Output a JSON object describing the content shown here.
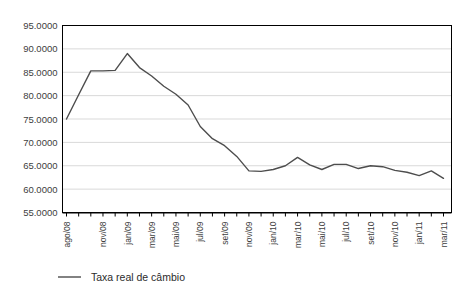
{
  "chart_data": {
    "type": "line",
    "title": "",
    "xlabel": "",
    "ylabel": "",
    "ylim": [
      55.0,
      95.0
    ],
    "ytick_step": 5.0,
    "ytick_labels": [
      "95.0000",
      "90.0000",
      "85.0000",
      "80.0000",
      "75.0000",
      "70.0000",
      "65.0000",
      "60.0000",
      "55.0000"
    ],
    "ytick_values": [
      95.0,
      90.0,
      85.0,
      80.0,
      75.0,
      70.0,
      65.0,
      60.0,
      55.0
    ],
    "grid": true,
    "grid_axis": "y",
    "legend_position": "bottom-left",
    "line_color": "#4d4d4d",
    "axis_color": "#000000",
    "grid_color": "#d9d9d9",
    "plot_background": "#ffffff",
    "x": [
      "ago/08",
      "set/08",
      "out/08",
      "nov/08",
      "dez/08",
      "jan/09",
      "fev/09",
      "mar/09",
      "abr/09",
      "mai/09",
      "jun/09",
      "jul/09",
      "ago/09",
      "set/09",
      "out/09",
      "nov/09",
      "dez/09",
      "jan/10",
      "fev/10",
      "mar/10",
      "abr/10",
      "mai/10",
      "jun/10",
      "jul/10",
      "ago/10",
      "set/10",
      "out/10",
      "nov/10",
      "dez/10",
      "jan/11",
      "fev/11",
      "mar/11"
    ],
    "xtick_labels_shown": [
      "ago/08",
      "nov/08",
      "jan/09",
      "mar/09",
      "mai/09",
      "jul/09",
      "set/09",
      "nov/09",
      "jan/10",
      "mar/10",
      "mai/10",
      "jul/10",
      "set/10",
      "nov/10",
      "jan/11",
      "mar/11"
    ],
    "series": [
      {
        "name": "Taxa real de câmbio",
        "values": [
          75.0,
          80.2,
          85.3,
          85.3,
          85.4,
          89.0,
          86.0,
          84.2,
          82.0,
          80.3,
          78.0,
          73.4,
          70.8,
          69.3,
          67.0,
          63.9,
          63.8,
          64.2,
          65.0,
          66.8,
          65.2,
          64.2,
          65.3,
          65.3,
          64.4,
          65.0,
          64.8,
          64.0,
          63.6,
          62.9,
          63.9,
          62.3
        ]
      }
    ]
  },
  "legend": {
    "items": [
      {
        "label": "Taxa real de câmbio",
        "color": "#4d4d4d"
      }
    ]
  }
}
